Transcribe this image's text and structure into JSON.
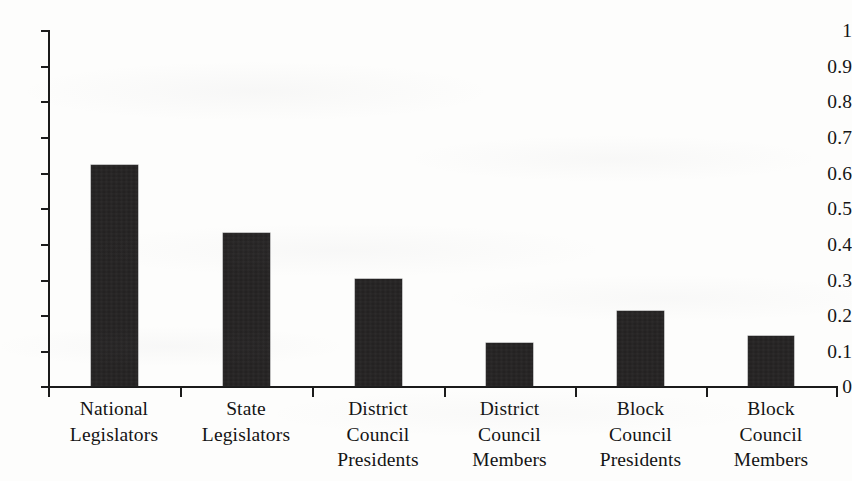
{
  "chart_data": {
    "type": "bar",
    "title": "",
    "subtitle": "",
    "xlabel": "",
    "ylabel": "",
    "categories": [
      "National\nLegislators",
      "State\nLegislators",
      "District\nCouncil\nPresidents",
      "District\nCouncil\nMembers",
      "Block\nCouncil\nPresidents",
      "Block\nCouncil\nMembers"
    ],
    "values": [
      0.62,
      0.43,
      0.3,
      0.12,
      0.21,
      0.14
    ],
    "ylim": [
      0,
      1
    ],
    "ytick_labels": [
      "0",
      "0.1",
      "0.2",
      "0.3",
      "0.4",
      "0.5",
      "0.6",
      "0.7",
      "0.8",
      "0.9",
      "1"
    ],
    "ytick_values": [
      0,
      0.1,
      0.2,
      0.3,
      0.4,
      0.5,
      0.6,
      0.7,
      0.8,
      0.9,
      1
    ],
    "grid": false,
    "legend": false,
    "legend_position": "none",
    "bar_color": "#211f1f",
    "axis_color": "#1b1b1b",
    "background_color": "#fdfdfc"
  }
}
